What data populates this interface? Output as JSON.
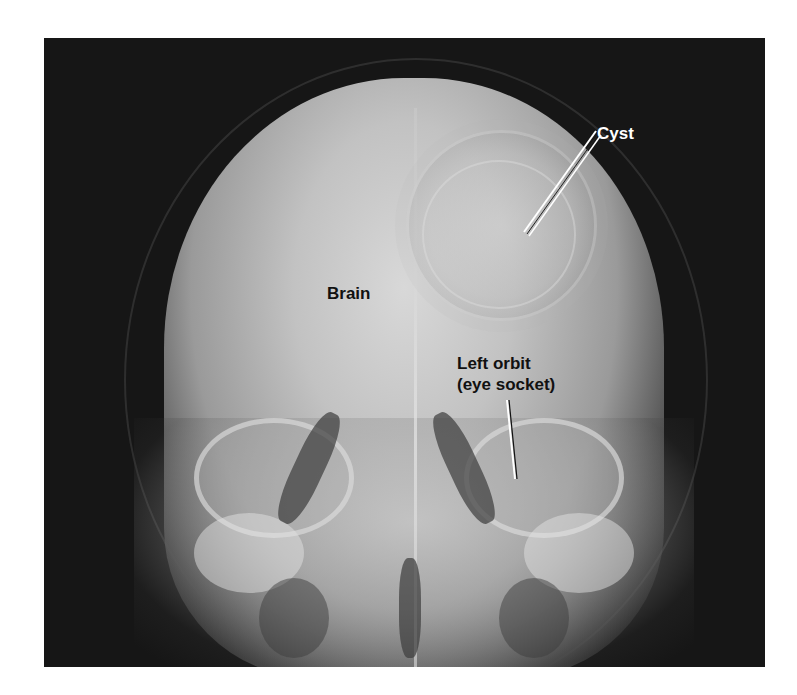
{
  "figure": {
    "background_color": "#ffffff",
    "image_background_color": "#161616"
  },
  "labels": {
    "cyst": "Cyst",
    "brain": "Brain",
    "left_orbit_line1": "Left orbit",
    "left_orbit_line2": "(eye socket)"
  }
}
